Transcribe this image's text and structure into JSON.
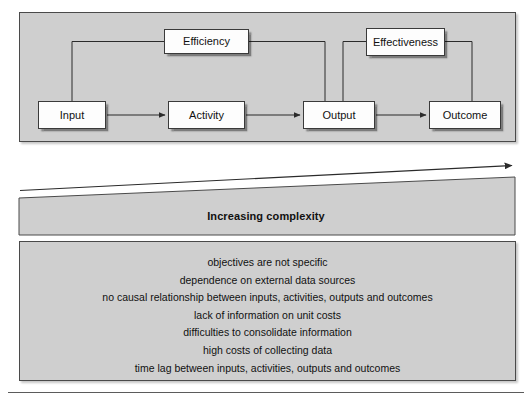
{
  "diagram": {
    "process_panel": {
      "nodes": [
        {
          "id": "input",
          "label": "Input"
        },
        {
          "id": "activity",
          "label": "Activity"
        },
        {
          "id": "output",
          "label": "Output"
        },
        {
          "id": "outcome",
          "label": "Outcome"
        },
        {
          "id": "efficiency",
          "label": "Efficiency"
        },
        {
          "id": "effectiveness",
          "label": "Effectiveness"
        }
      ],
      "flow_arrows": [
        {
          "from": "Input",
          "to": "Activity"
        },
        {
          "from": "Activity",
          "to": "Output"
        },
        {
          "from": "Output",
          "to": "Outcome"
        }
      ],
      "measure_links": [
        {
          "measure": "Efficiency",
          "spans": [
            "Input",
            "Output"
          ]
        },
        {
          "measure": "Effectiveness",
          "spans": [
            "Output",
            "Outcome"
          ]
        }
      ]
    },
    "complexity": {
      "label": "Increasing complexity",
      "direction": "left-to-right increasing"
    },
    "issues": {
      "lines": [
        "objectives are not specific",
        "dependence on external data sources",
        "no causal relationship between inputs, activities, outputs and outcomes",
        "lack of information on unit costs",
        "difficulties to consolidate information",
        "high costs of collecting data",
        "time lag between inputs, activities, outputs and outcomes"
      ]
    },
    "colors": {
      "panel_fill": "#cfcfcf",
      "panel_border": "#4a4a4a",
      "node_fill": "#fdfdfd",
      "node_border": "#3a3a3a",
      "line": "#2b2b2b"
    }
  }
}
